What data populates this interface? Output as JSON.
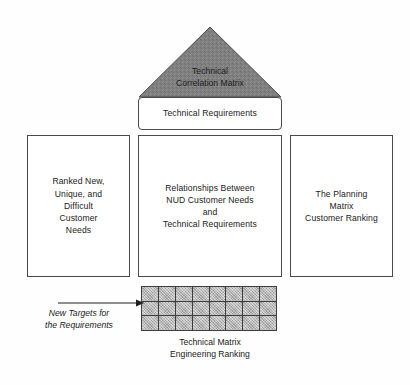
{
  "diagram": {
    "name": "House of Quality (QFD) Matrix",
    "type": "house-of-quality",
    "roof": {
      "label": "Technical\nCorrelation Matrix",
      "fill_color": "#808080",
      "stroke_color": "#4a4a4a"
    },
    "technical_requirements": {
      "label": "Technical Requirements"
    },
    "columns": [
      {
        "id": "customer-needs",
        "label": "Ranked New,\nUnique, and\nDifficult\nCustomer\nNeeds"
      },
      {
        "id": "relationship-matrix",
        "label": "Relationships Between\nNUD Customer Needs\nand\nTechnical Requirements"
      },
      {
        "id": "planning-matrix",
        "label": "The Planning\nMatrix\nCustomer Ranking"
      }
    ],
    "bottom_matrix": {
      "caption": "Technical Matrix\nEngineering Ranking",
      "rows": 3,
      "cols": 8,
      "cell_color": "#b2b2b2",
      "border_color": "#3d3d3d"
    },
    "annotation": {
      "label": "New Targets for\nthe Requirements",
      "arrow": "right-arrow"
    },
    "colors": {
      "background": "#fefefe",
      "text": "#1a1a1a",
      "box_border": "#4a4a4a"
    }
  }
}
